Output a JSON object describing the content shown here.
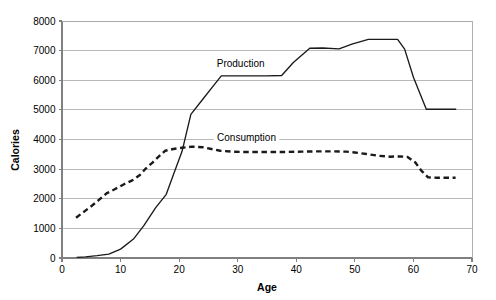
{
  "chart_data": {
    "type": "line",
    "title": "",
    "xlabel": "Age",
    "ylabel": "Calories",
    "xlim": [
      0,
      70
    ],
    "ylim": [
      0,
      8000
    ],
    "xticks": [
      0,
      10,
      20,
      30,
      40,
      50,
      60,
      70
    ],
    "yticks": [
      0,
      1000,
      2000,
      3000,
      4000,
      5000,
      6000,
      7000,
      8000
    ],
    "xtick_labels": [
      "0",
      "10",
      "20",
      "30",
      "40",
      "50",
      "60",
      "70"
    ],
    "ytick_labels": [
      "0",
      "1000",
      "2000",
      "3000",
      "4000",
      "5000",
      "6000",
      "7000",
      "8000"
    ],
    "grid": "horizontal",
    "legend_position": "inline-annotations",
    "series": [
      {
        "name": "Production",
        "style": "solid",
        "color": "#1a1a1a",
        "label_x": 30.5,
        "label_y": 6450,
        "x": [
          2.5,
          4,
          6,
          8,
          10,
          12.2,
          14,
          16,
          17.8,
          19,
          20.5,
          22,
          24,
          25.6,
          27.2,
          30,
          33,
          35,
          37.5,
          39.5,
          42.3,
          44.5,
          47.3,
          49.5,
          52.3,
          55,
          57.3,
          58.5,
          60,
          62.2,
          64,
          67.3
        ],
        "y": [
          20,
          40,
          80,
          130,
          300,
          640,
          1100,
          1700,
          2150,
          2800,
          3600,
          4850,
          5350,
          5750,
          6150,
          6150,
          6150,
          6150,
          6160,
          6600,
          7080,
          7090,
          7060,
          7220,
          7380,
          7380,
          7380,
          7050,
          6100,
          5020,
          5020,
          5020
        ]
      },
      {
        "name": "Consumption",
        "style": "dashed",
        "color": "#1a1a1a",
        "label_x": 31.5,
        "label_y": 3960,
        "x": [
          2.4,
          4,
          5.2,
          6.3,
          7.6,
          9,
          10.5,
          12,
          13.3,
          14.3,
          15.5,
          16.5,
          17.6,
          19,
          20.5,
          22.2,
          24,
          25.5,
          27,
          29,
          31,
          33.5,
          36,
          38.5,
          41,
          43.5,
          46,
          48.5,
          50,
          52,
          54,
          56,
          57.8,
          59,
          60.3,
          61.3,
          62.5,
          64,
          65.5,
          67.2
        ],
        "y": [
          1360,
          1600,
          1780,
          1960,
          2180,
          2320,
          2480,
          2620,
          2800,
          3020,
          3230,
          3420,
          3620,
          3680,
          3720,
          3760,
          3740,
          3680,
          3620,
          3590,
          3580,
          3580,
          3580,
          3580,
          3590,
          3600,
          3600,
          3590,
          3560,
          3510,
          3450,
          3420,
          3430,
          3410,
          3230,
          2960,
          2720,
          2710,
          2710,
          2710
        ]
      }
    ]
  },
  "axes": {
    "x_title": "Age",
    "y_title": "Calories"
  }
}
